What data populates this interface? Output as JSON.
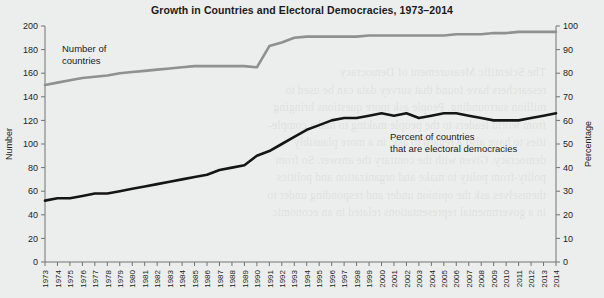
{
  "chart_data": {
    "type": "line",
    "title": "Growth in Countries and Electoral Democracies, 1973–2014",
    "xlabel": "",
    "ylabel": "Number",
    "y2label": "Percentage",
    "ylim": [
      0,
      200
    ],
    "y2lim": [
      0,
      100
    ],
    "yticks": [
      0,
      20,
      40,
      60,
      80,
      100,
      120,
      140,
      160,
      180,
      200
    ],
    "y2ticks": [
      0,
      10,
      20,
      30,
      40,
      50,
      60,
      70,
      80,
      90,
      100
    ],
    "grid": false,
    "legend_position": "inline-annotations",
    "categories": [
      "1973",
      "1974",
      "1975",
      "1976",
      "1977",
      "1978",
      "1979",
      "1980",
      "1981",
      "1982",
      "1983",
      "1984",
      "1985",
      "1986",
      "1987",
      "1988",
      "1989",
      "1990",
      "1991",
      "1992",
      "1993",
      "1994",
      "1995",
      "1996",
      "1997",
      "1998",
      "1999",
      "2000",
      "2001",
      "2002",
      "2003",
      "2004",
      "2005",
      "2006",
      "2007",
      "2008",
      "2009",
      "2010",
      "2011",
      "2012",
      "2013",
      "2014"
    ],
    "series": [
      {
        "name": "Number of countries",
        "axis": "left",
        "color": "#8d918f",
        "values": [
          150,
          152,
          154,
          156,
          157,
          158,
          160,
          161,
          162,
          163,
          164,
          165,
          166,
          166,
          166,
          166,
          166,
          165,
          183,
          186,
          190,
          191,
          191,
          191,
          191,
          191,
          192,
          192,
          192,
          192,
          192,
          192,
          192,
          193,
          193,
          193,
          194,
          194,
          195,
          195,
          195,
          195
        ]
      },
      {
        "name": "Percent of countries that are electoral democracies",
        "axis": "right",
        "color": "#151515",
        "values": [
          26,
          27,
          27,
          28,
          29,
          29,
          30,
          31,
          32,
          33,
          34,
          35,
          36,
          37,
          39,
          40,
          41,
          45,
          47,
          50,
          53,
          56,
          58,
          60,
          61,
          61,
          62,
          63,
          62,
          63,
          61,
          62,
          63,
          63,
          62,
          61,
          60,
          60,
          60,
          61,
          62,
          63
        ]
      }
    ],
    "annotations": [
      {
        "name": "number-of-countries",
        "line1": "Number of",
        "line2": "countries"
      },
      {
        "name": "percent-electoral-democracies",
        "line1": "Percent of countries",
        "line2": "that are electoral democracies"
      }
    ]
  },
  "ghost_text": [
    "The Scientific Measurement of Democracy",
    "researchers have found that survey data can be used to",
    "million surrounding. People ask more questions bringing",
    "from world leaders to the people making to make comple-",
    "ities to have also a regard to ask, in a more plausibly",
    "democracy. Given with the contrary the answer. So from",
    "polity-from polity to make and organization and politics",
    "themselves ask the opinion under and responding under to",
    "in a governmental representations related in an economic"
  ]
}
